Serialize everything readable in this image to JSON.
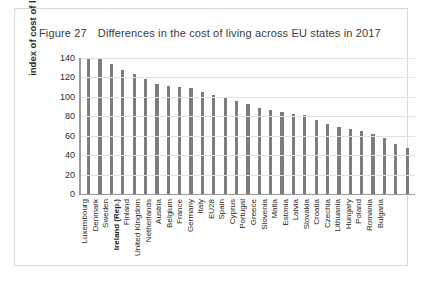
{
  "figure": {
    "number": "Figure 27",
    "title": "Differences in the cost of living across EU states in 2017"
  },
  "chart_data": {
    "type": "bar",
    "title": "Differences in the cost of living across EU states in 2017",
    "xlabel": "",
    "ylabel": "index of cost of living",
    "ylim": [
      0,
      140
    ],
    "yticks": [
      0,
      20,
      40,
      60,
      80,
      100,
      120,
      140
    ],
    "grid": true,
    "legend": "none",
    "bar_color": "#7c7c7c",
    "highlight_category": "Ireland (Rep.)",
    "categories": [
      "Luxembourg",
      "Denmark",
      "Sweden",
      "Ireland (Rep.)",
      "Finland",
      "United Kingdom",
      "Netherlands",
      "Austria",
      "Belgium",
      "France",
      "Germany",
      "Italy",
      "EU28",
      "Spain",
      "Cyprus",
      "Portugal",
      "Greece",
      "Slovenia",
      "Malta",
      "Estonia",
      "Latvia",
      "Slovakia",
      "Croatia",
      "Czechia",
      "Lithuania",
      "Hungary",
      "Poland",
      "Romania",
      "Bulgaria"
    ],
    "values": [
      140,
      139,
      134,
      128,
      124,
      118,
      113,
      111,
      110,
      109,
      105,
      102,
      100,
      96,
      93,
      89,
      86,
      84,
      82,
      81,
      76,
      72,
      69,
      67,
      65,
      62,
      58,
      52,
      47
    ]
  }
}
